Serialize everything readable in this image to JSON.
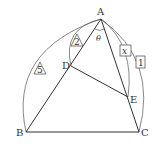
{
  "diagram": {
    "points": {
      "A": {
        "label": "A",
        "x": 101,
        "y": 19
      },
      "B": {
        "label": "B",
        "x": 26,
        "y": 132
      },
      "C": {
        "label": "C",
        "x": 139,
        "y": 132
      },
      "D": {
        "label": "D",
        "x": 71,
        "y": 66
      },
      "E": {
        "label": "E",
        "x": 128,
        "y": 97
      }
    },
    "angle_label": "θ",
    "lengths": {
      "AB": {
        "text": "5",
        "shape": "triangle"
      },
      "AD": {
        "text": "2",
        "shape": "triangle"
      },
      "AE": {
        "text": "x",
        "shape": "box"
      },
      "AC": {
        "text": "1",
        "shape": "box"
      }
    },
    "colors": {
      "line": "#333333",
      "arc": "#555555",
      "background": "#ffffff"
    }
  }
}
